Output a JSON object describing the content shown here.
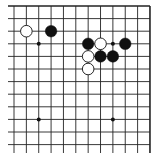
{
  "diagram": {
    "type": "go-board-fragment",
    "visible_edges": [
      "top",
      "right"
    ],
    "columns": 12,
    "rows": 12,
    "origin_x": 14,
    "origin_y": 6,
    "spacing_x": 12.36,
    "spacing_y": 12.6,
    "line_color": "#222222",
    "background": "#ffffff",
    "star_points": [
      {
        "col": 2,
        "row": 3
      },
      {
        "col": 8,
        "row": 3
      },
      {
        "col": 2,
        "row": 9
      },
      {
        "col": 8,
        "row": 9
      }
    ],
    "stones": [
      {
        "color": "white",
        "col": 1,
        "row": 2
      },
      {
        "color": "black",
        "col": 3,
        "row": 2
      },
      {
        "color": "black",
        "col": 6,
        "row": 3
      },
      {
        "color": "white",
        "col": 7,
        "row": 3
      },
      {
        "color": "black",
        "col": 9,
        "row": 3
      },
      {
        "color": "white",
        "col": 6,
        "row": 4
      },
      {
        "color": "black",
        "col": 7,
        "row": 4
      },
      {
        "color": "black",
        "col": 8,
        "row": 4
      },
      {
        "color": "white",
        "col": 6,
        "row": 5
      }
    ]
  }
}
